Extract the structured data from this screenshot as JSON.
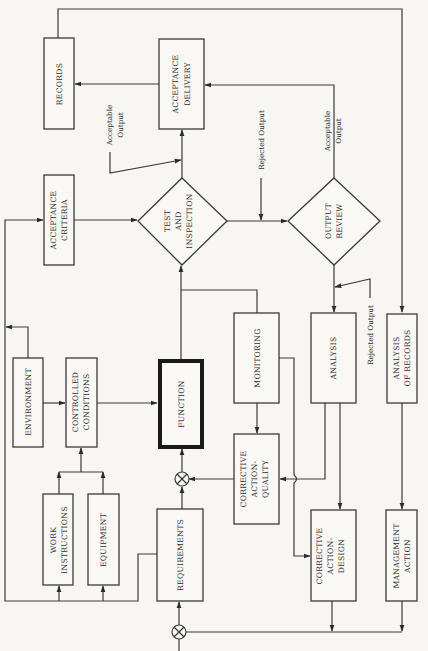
{
  "diagram": {
    "orientation": "rotated 90° counter-clockwise (text reads bottom-to-top)",
    "colors": {
      "background": "#f7f6f3",
      "stroke": "#3a3a3a",
      "text": "#2e2e2e"
    },
    "nodes": {
      "records": {
        "line1": "RECORDS",
        "line2": ""
      },
      "acceptance_delivery": {
        "line1": "ACCEPTANCE",
        "line2": "DELIVERY"
      },
      "acceptance_criteria": {
        "line1": "ACCEPTANCE",
        "line2": "CRITERIA"
      },
      "test_inspection": {
        "line1": "TEST",
        "line2": "AND",
        "line3": "INSPECTION"
      },
      "output_review": {
        "line1": "OUTPUT",
        "line2": "REVIEW"
      },
      "environment": {
        "line1": "ENVIRONMENT"
      },
      "controlled_conditions": {
        "line1": "CONTROLLED",
        "line2": "CONDITIONS"
      },
      "function": {
        "line1": "FUNCTION"
      },
      "monitoring": {
        "line1": "MONITORING"
      },
      "analysis": {
        "line1": "ANALYSIS"
      },
      "analysis_of_records": {
        "line1": "ANALYSIS",
        "line2": "OF RECORDS"
      },
      "corrective_action_quality": {
        "line1": "CORRECTIVE",
        "line2": "ACTION-",
        "line3": "QUALITY"
      },
      "work_instructions": {
        "line1": "WORK",
        "line2": "INSTRUCTIONS"
      },
      "equipment": {
        "line1": "EQUIPMENT"
      },
      "requirements": {
        "line1": "REQUIREMENTS"
      },
      "corrective_action_design": {
        "line1": "CORRECTIVE",
        "line2": "ACTION-",
        "line3": "DESIGN"
      },
      "management_action": {
        "line1": "MANAGEMENT",
        "line2": "ACTION"
      }
    },
    "edge_labels": {
      "acceptable_output_1": {
        "line1": "Acceptable",
        "line2": "Output"
      },
      "rejected_output_1": {
        "line1": "Rejected Output"
      },
      "acceptable_output_2": {
        "line1": "Acceptable",
        "line2": "Output"
      },
      "rejected_output_2": {
        "line1": "Rejected Output"
      }
    },
    "junctions": [
      {
        "name": "summing-junction-function",
        "symbol": "⊗"
      },
      {
        "name": "summing-junction-requirements",
        "symbol": "⊗"
      }
    ],
    "edges": [
      {
        "from": "Acceptance Delivery",
        "to": "Records"
      },
      {
        "from": "Output Review",
        "to": "Acceptance Delivery",
        "label": "Acceptable Output"
      },
      {
        "from": "Test and Inspection",
        "to": "Acceptance Delivery",
        "label": "Acceptable Output"
      },
      {
        "from": "Records",
        "to": "Analysis of Records"
      },
      {
        "from": "Acceptance Criteria",
        "to": "Test and Inspection"
      },
      {
        "from": "Test and Inspection",
        "to": "Output Review",
        "label": "Rejected Output"
      },
      {
        "from": "Output Review",
        "to": "Analysis",
        "label": "Rejected Output"
      },
      {
        "from": "Environment",
        "to": "Controlled Conditions"
      },
      {
        "from": "Environment",
        "to": "Left bus"
      },
      {
        "from": "Work Instructions",
        "to": "Controlled Conditions"
      },
      {
        "from": "Equipment",
        "to": "Controlled Conditions"
      },
      {
        "from": "Controlled Conditions",
        "to": "Function"
      },
      {
        "from": "Function",
        "to": "Test and Inspection"
      },
      {
        "from": "Function",
        "to": "Monitoring"
      },
      {
        "from": "Monitoring",
        "to": "Corrective Action-Quality"
      },
      {
        "from": "Monitoring",
        "to": "Corrective Action-Design"
      },
      {
        "from": "Analysis",
        "to": "Corrective Action-Quality"
      },
      {
        "from": "Analysis",
        "to": "Corrective Action-Design"
      },
      {
        "from": "Corrective Action-Quality",
        "to": "Function junction"
      },
      {
        "from": "Requirements",
        "to": "Function junction"
      },
      {
        "from": "Requirements",
        "to": "Work Instructions / Equipment / Acceptance Criteria"
      },
      {
        "from": "Analysis of Records",
        "to": "Management Action"
      },
      {
        "from": "Corrective Action-Design",
        "to": "Requirements junction"
      },
      {
        "from": "Management Action",
        "to": "Requirements junction"
      }
    ]
  }
}
